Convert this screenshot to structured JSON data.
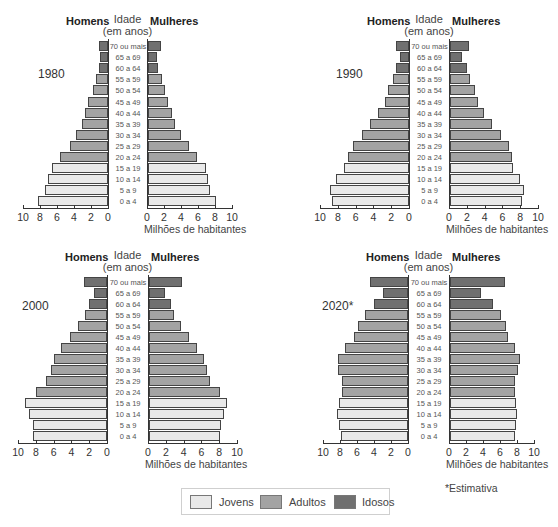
{
  "labels": {
    "homens": "Homens",
    "mulheres": "Mulheres",
    "idade": "Idade",
    "em_anos": "(em anos)",
    "xlabel": "Milhões de habitantes",
    "note": "*Estimativa"
  },
  "legend": [
    {
      "label": "Jovens",
      "color": "#e9e9e9"
    },
    {
      "label": "Adultos",
      "color": "#a3a3a3"
    },
    {
      "label": "Idosos",
      "color": "#707070"
    }
  ],
  "chart_data": [
    {
      "type": "bar",
      "subtype": "population-pyramid",
      "title": "1980",
      "categories": [
        "70 ou mais",
        "65 a 69",
        "60 a 64",
        "55 a 59",
        "50 a 54",
        "45 a 49",
        "40 a 44",
        "35 a 39",
        "30 a 34",
        "25 a 29",
        "20 a 24",
        "15 a 19",
        "10 a 14",
        "5 a 9",
        "0 a 4"
      ],
      "groups": [
        "idosos",
        "idosos",
        "idosos",
        "adultos",
        "adultos",
        "adultos",
        "adultos",
        "adultos",
        "adultos",
        "adultos",
        "adultos",
        "jovens",
        "jovens",
        "jovens",
        "jovens"
      ],
      "series": [
        {
          "name": "Homens",
          "values": [
            1.1,
            0.9,
            1.1,
            1.4,
            1.8,
            2.3,
            2.7,
            3.1,
            3.8,
            4.5,
            5.7,
            6.6,
            7.1,
            7.4,
            8.2
          ]
        },
        {
          "name": "Mulheres",
          "values": [
            1.5,
            1.0,
            1.2,
            1.6,
            2.0,
            2.3,
            2.8,
            3.2,
            3.9,
            4.8,
            5.8,
            6.8,
            7.0,
            7.3,
            8.0
          ]
        }
      ],
      "xlabel": "Milhões de habitantes",
      "ylabel": "Idade (em anos)",
      "xlim": [
        0,
        10
      ],
      "xticks": [
        "10",
        "8",
        "6",
        "4",
        "2",
        "0",
        "0",
        "2",
        "4",
        "6",
        "8",
        "10"
      ],
      "legend": [
        "Jovens",
        "Adultos",
        "Idosos"
      ]
    },
    {
      "type": "bar",
      "subtype": "population-pyramid",
      "title": "1990",
      "categories": [
        "70 ou mais",
        "65 a 69",
        "60 a 64",
        "55 a 59",
        "50 a 54",
        "45 a 49",
        "40 a 44",
        "35 a 39",
        "30 a 34",
        "25 a 29",
        "20 a 24",
        "15 a 19",
        "10 a 14",
        "5 a 9",
        "0 a 4"
      ],
      "groups": [
        "idosos",
        "idosos",
        "idosos",
        "adultos",
        "adultos",
        "adultos",
        "adultos",
        "adultos",
        "adultos",
        "adultos",
        "adultos",
        "jovens",
        "jovens",
        "jovens",
        "jovens"
      ],
      "series": [
        {
          "name": "Homens",
          "values": [
            1.5,
            1.0,
            1.5,
            1.8,
            2.4,
            2.7,
            3.5,
            4.4,
            5.3,
            6.3,
            6.9,
            7.3,
            8.2,
            8.9,
            8.7
          ]
        },
        {
          "name": "Mulheres",
          "values": [
            2.1,
            1.3,
            1.9,
            2.3,
            2.8,
            3.1,
            3.8,
            4.7,
            5.7,
            6.6,
            7.0,
            7.1,
            7.9,
            8.3,
            8.1
          ]
        }
      ],
      "xlabel": "Milhões de habitantes",
      "ylabel": "Idade (em anos)",
      "xlim": [
        0,
        10
      ],
      "xticks": [
        "10",
        "8",
        "6",
        "4",
        "2",
        "0",
        "0",
        "2",
        "4",
        "6",
        "8",
        "10"
      ],
      "legend": [
        "Jovens",
        "Adultos",
        "Idosos"
      ]
    },
    {
      "type": "bar",
      "subtype": "population-pyramid",
      "title": "2000",
      "categories": [
        "70 ou mais",
        "65 a 69",
        "60 a 64",
        "55 a 59",
        "50 a 54",
        "45 a 49",
        "40 a 44",
        "35 a 39",
        "30 a 34",
        "25 a 29",
        "20 a 24",
        "15 a 19",
        "10 a 14",
        "5 a 9",
        "0 a 4"
      ],
      "groups": [
        "idosos",
        "idosos",
        "idosos",
        "adultos",
        "adultos",
        "adultos",
        "adultos",
        "adultos",
        "adultos",
        "adultos",
        "adultos",
        "jovens",
        "jovens",
        "jovens",
        "jovens"
      ],
      "series": [
        {
          "name": "Homens",
          "values": [
            2.6,
            1.5,
            2.0,
            2.5,
            3.3,
            4.2,
            5.2,
            6.0,
            6.3,
            6.8,
            8.0,
            9.2,
            8.8,
            8.3,
            8.3
          ]
        },
        {
          "name": "Mulheres",
          "values": [
            3.7,
            1.8,
            2.5,
            2.8,
            3.6,
            4.5,
            5.4,
            6.2,
            6.5,
            6.9,
            8.0,
            8.8,
            8.4,
            8.1,
            8.0
          ]
        }
      ],
      "xlabel": "Milhões de habitantes",
      "ylabel": "Idade (em anos)",
      "xlim": [
        0,
        10
      ],
      "xticks": [
        "10",
        "8",
        "6",
        "4",
        "2",
        "0",
        "0",
        "2",
        "4",
        "6",
        "8",
        "10"
      ],
      "legend": [
        "Jovens",
        "Adultos",
        "Idosos"
      ]
    },
    {
      "type": "bar",
      "subtype": "population-pyramid",
      "title": "2020*",
      "categories": [
        "70 ou mais",
        "65 a 69",
        "60 a 64",
        "55 a 59",
        "50 a 54",
        "45 a 49",
        "40 a 44",
        "35 a 39",
        "30 a 34",
        "25 a 29",
        "20 a 24",
        "15 a 19",
        "10 a 14",
        "5 a 9",
        "0 a 4"
      ],
      "groups": [
        "idosos",
        "idosos",
        "idosos",
        "adultos",
        "adultos",
        "adultos",
        "adultos",
        "adultos",
        "adultos",
        "adultos",
        "adultos",
        "jovens",
        "jovens",
        "jovens",
        "jovens"
      ],
      "series": [
        {
          "name": "Homens",
          "values": [
            4.5,
            2.9,
            4.0,
            5.1,
            5.9,
            6.4,
            7.4,
            8.2,
            8.2,
            7.8,
            7.8,
            8.1,
            8.3,
            8.1,
            7.9
          ]
        },
        {
          "name": "Mulheres",
          "values": [
            6.5,
            3.7,
            5.0,
            6.0,
            6.6,
            6.8,
            7.7,
            8.2,
            8.0,
            7.7,
            7.6,
            7.8,
            7.9,
            7.8,
            7.6
          ]
        }
      ],
      "xlabel": "Milhões de habitantes",
      "ylabel": "Idade (em anos)",
      "xlim": [
        0,
        10
      ],
      "xticks": [
        "10",
        "8",
        "6",
        "4",
        "2",
        "0",
        "0",
        "2",
        "4",
        "6",
        "8",
        "10"
      ],
      "legend": [
        "Jovens",
        "Adultos",
        "Idosos"
      ],
      "annotation": "*Estimativa"
    }
  ]
}
